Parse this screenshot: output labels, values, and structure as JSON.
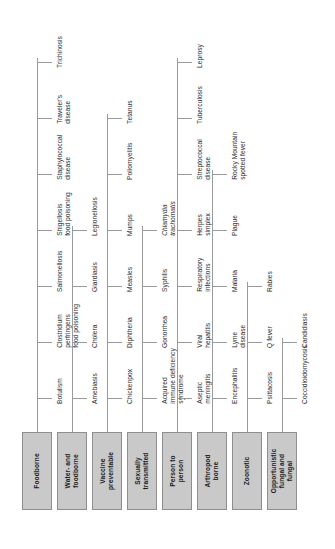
{
  "diagram": {
    "orientation": "rotated-90-counterclockwise",
    "box_fill_color": "#c9c9c9",
    "box_border_color": "#8e8e8e",
    "line_color": "#9a9a9a",
    "background_color": "#ffffff",
    "categories": [
      {
        "id": "foodborne",
        "label": "Foodborne",
        "leaves": [
          "Botulism",
          "Clostridium\nperfringens\nfood poisoning",
          "Salmonellosis",
          "Shigellosis\nfood poisoning",
          "Staphylococcal\ndisease",
          "Traveler's\ndisease",
          "Trichinosis"
        ]
      },
      {
        "id": "water-and-foodborne",
        "label": "Water- and\nfoodborne",
        "leaves": [
          "Amebiasis",
          "Cholera",
          "Giardiasis",
          "Legionellosis"
        ]
      },
      {
        "id": "vaccine-preventable",
        "label": "Vaccine\npreventable",
        "leaves": [
          "Chickenpox",
          "Diphtheria",
          "Measles",
          "Mumps",
          "Poliomyelitis",
          "Tetanus"
        ]
      },
      {
        "id": "sexually-transmitted",
        "label": "Sexually\ntransmitted",
        "leaves": [
          "Acquired\nimmune deficiency\nsyndrome",
          "Gonorrhea",
          "Syphilis",
          "Chlamydia\ntrachomatis"
        ]
      },
      {
        "id": "person-to-person",
        "label": "Person to\nperson",
        "leaves": [
          "Aseptic\nmeningitis",
          "Viral\nhepatitis",
          "Respiratory\ninfections",
          "Herpes\nsimplex",
          "Streptococcal\ndisease",
          "Tuberculosis",
          "Leprosy"
        ]
      },
      {
        "id": "arthropod-borne",
        "label": "Arthropod\nborne",
        "leaves": [
          "Encephalitis",
          "Lyme\ndisease",
          "Malaria",
          "Plague",
          "Rocky Mountain\nspotted fever"
        ]
      },
      {
        "id": "zoonotic",
        "label": "Zoonotic",
        "leaves": [
          "Psittacosis",
          "Q fever",
          "Rabies"
        ]
      },
      {
        "id": "opportunistic-fungal",
        "label": "Opportunistic\nfungal and\nfungal",
        "leaves": [
          "Coccidioidomycosis",
          "Candidiasis"
        ]
      }
    ]
  }
}
